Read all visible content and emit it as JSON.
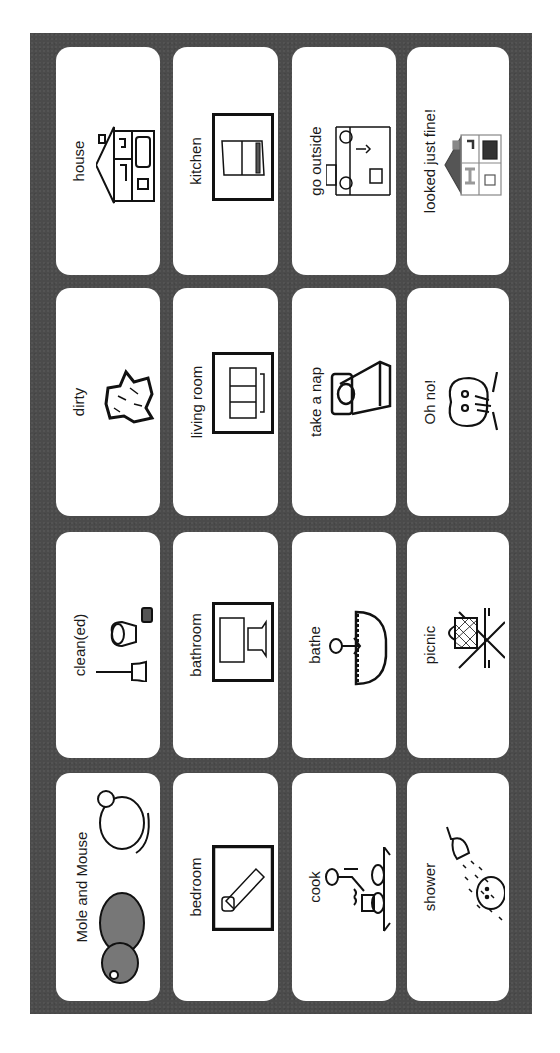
{
  "board": {
    "background_color": "#4b4b4b",
    "card_color": "#ffffff",
    "text_orientation": "rotated -90deg (reads bottom-to-top)"
  },
  "columns": [
    {
      "cards": [
        {
          "label": "house",
          "icon": "house-icon"
        },
        {
          "label": "dirty",
          "icon": "dirt-stain-icon"
        },
        {
          "label": "clean(ed)",
          "icon": "broom-bucket-sponge-icon"
        },
        {
          "label": "Mole and Mouse",
          "icon": "mole-and-mouse-icon"
        }
      ]
    },
    {
      "cards": [
        {
          "label": "kitchen",
          "icon": "refrigerator-icon"
        },
        {
          "label": "living room",
          "icon": "sofa-icon"
        },
        {
          "label": "bathroom",
          "icon": "bathtub-toilet-icon"
        },
        {
          "label": "bedroom",
          "icon": "bed-icon"
        }
      ]
    },
    {
      "cards": [
        {
          "label": "go outside",
          "icon": "exit-door-outside-icon"
        },
        {
          "label": "take a nap",
          "icon": "bed-pillow-icon"
        },
        {
          "label": "bathe",
          "icon": "person-in-bathtub-icon"
        },
        {
          "label": "cook",
          "icon": "person-cooking-stove-icon"
        }
      ]
    },
    {
      "cards": [
        {
          "label": "looked just fine!",
          "icon": "clean-house-icon"
        },
        {
          "label": "Oh no!",
          "icon": "surprised-face-icon"
        },
        {
          "label": "picnic",
          "icon": "picnic-basket-table-icon"
        },
        {
          "label": "shower",
          "icon": "shower-head-icon"
        }
      ]
    }
  ]
}
